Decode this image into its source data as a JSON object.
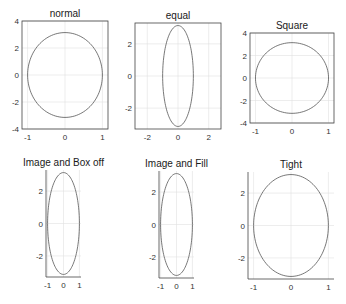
{
  "chart_data": [
    {
      "type": "line",
      "title": "normal",
      "axis_mode": "normal",
      "box": true,
      "curve": "circle x=cos(t), y=pi*sin(t)",
      "xlim": [
        -1.15,
        1.15
      ],
      "ylim": [
        -4,
        4
      ],
      "xticks": [
        -1,
        0,
        1
      ],
      "yticks": [
        -4,
        -2,
        0,
        2,
        4
      ],
      "grid": true,
      "px": {
        "x0": 22,
        "y0": 21,
        "x1": 108,
        "y1": 129
      }
    },
    {
      "type": "line",
      "title": "equal",
      "axis_mode": "equal",
      "box": true,
      "curve": "x=cos(t), y=pi*sin(t)",
      "xlim": [
        -2.8,
        2.8
      ],
      "ylim": [
        -3.3,
        3.3
      ],
      "xticks": [
        -2,
        0,
        2
      ],
      "yticks": [
        -2,
        0,
        2
      ],
      "grid": true,
      "px": {
        "x0": 135,
        "y0": 23,
        "x1": 221,
        "y1": 129
      }
    },
    {
      "type": "line",
      "title": "Square",
      "axis_mode": "square",
      "box": true,
      "curve": "x=cos(t), y=pi*sin(t)",
      "xlim": [
        -1.15,
        1.15
      ],
      "ylim": [
        -4,
        4
      ],
      "xticks": [
        -1,
        0,
        1
      ],
      "yticks": [
        -4,
        -2,
        0,
        2,
        4
      ],
      "grid": true,
      "px": {
        "x0": 250,
        "y0": 33,
        "x1": 334,
        "y1": 123
      }
    },
    {
      "type": "line",
      "title": "Image and Box off",
      "axis_mode": "image",
      "box": false,
      "curve": "x=cos(t), y=pi*sin(t)",
      "xlim": [
        -1.1,
        1.1
      ],
      "ylim": [
        -3.3,
        3.3
      ],
      "xticks": [
        -1,
        0,
        1
      ],
      "yticks": [
        -2,
        0,
        2
      ],
      "grid": true,
      "px": {
        "x0": 46,
        "y0": 170,
        "x1": 81,
        "y1": 277
      }
    },
    {
      "type": "line",
      "title": "Image and Fill",
      "axis_mode": "image",
      "box": false,
      "curve": "x=cos(t), y=pi*sin(t)",
      "xlim": [
        -1.1,
        1.1
      ],
      "ylim": [
        -3.3,
        3.3
      ],
      "xticks": [
        -1,
        0,
        1
      ],
      "yticks": [
        -2,
        0,
        2
      ],
      "grid": true,
      "px": {
        "x0": 159,
        "y0": 171,
        "x1": 194,
        "y1": 278
      }
    },
    {
      "type": "line",
      "title": "Tight",
      "axis_mode": "tight",
      "box": false,
      "curve": "x=cos(t), y=pi*sin(t)",
      "xlim": [
        -1.15,
        1.15
      ],
      "ylim": [
        -3.3,
        3.3
      ],
      "xticks": [
        -1,
        0,
        1
      ],
      "yticks": [
        -2,
        0,
        2
      ],
      "grid": true,
      "px": {
        "x0": 248,
        "y0": 172,
        "x1": 334,
        "y1": 279
      }
    }
  ],
  "colors": {
    "curve": "#555555",
    "axis": "#444444",
    "grid": "#e0e0e0"
  }
}
